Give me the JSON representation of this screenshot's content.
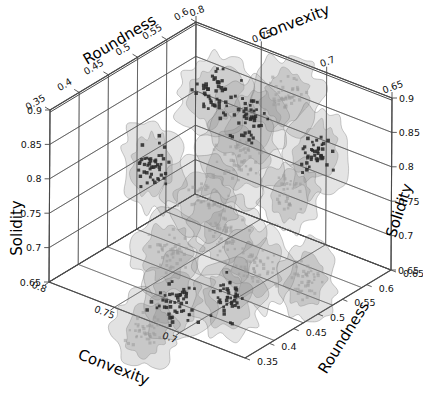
{
  "figure": {
    "type": "3d-scatter",
    "background": "#ffffff",
    "line_color": "#4a4a4a",
    "blob_fill": "#8c8c8c",
    "point_dark": "#2b2b2b",
    "point_light": "#9a9a9a"
  },
  "axes": {
    "top_left": {
      "name": "roundness-top-left",
      "title": "Roundness",
      "ticks": [
        "0.35",
        "0.4",
        "0.45",
        "0.5",
        "0.55",
        "0.6"
      ]
    },
    "top_right": {
      "name": "convexity-top-right",
      "title": "Convexity",
      "ticks": [
        "0.8",
        "0.75",
        "0.7",
        "0.65"
      ]
    },
    "left": {
      "name": "solidity-left",
      "title": "Solidity",
      "ticks": [
        "0.9",
        "0.85",
        "0.8",
        "0.75",
        "0.7",
        "0.65"
      ]
    },
    "right": {
      "name": "solidity-right",
      "title": "Solidity",
      "ticks": [
        "0.9",
        "0.85",
        "0.8",
        "0.75",
        "0.7",
        "0.65"
      ]
    },
    "bottom_left": {
      "name": "convexity-bottom-left",
      "title": "Convexity",
      "ticks": [
        "0.8",
        "0.75",
        "0.7"
      ]
    },
    "bottom_right": {
      "name": "roundness-bottom-right",
      "title": "Roundness",
      "ticks": [
        "0.65",
        "0.6",
        "0.55",
        "0.5",
        "0.45",
        "0.4",
        "0.35"
      ]
    }
  },
  "chart_data": {
    "type": "scatter",
    "title": "",
    "xlabel": "Roundness",
    "ylabel": "Convexity",
    "zlabel": "Solidity",
    "xlim": [
      0.35,
      0.6
    ],
    "ylim": [
      0.65,
      0.8
    ],
    "zlim": [
      0.65,
      0.9
    ],
    "grid": true,
    "legend": "none",
    "projection": "3d-isometric",
    "clusters": [
      {
        "id": "c1",
        "cx": 152,
        "cy": 165,
        "rx": 32,
        "ry": 48,
        "rot": -8,
        "shade": 0.46,
        "n": 46,
        "point_tone": "dark",
        "spread": 20
      },
      {
        "id": "c2",
        "cx": 215,
        "cy": 96,
        "rx": 40,
        "ry": 46,
        "rot": 5,
        "shade": 0.38,
        "n": 52,
        "point_tone": "dark",
        "spread": 24
      },
      {
        "id": "c3",
        "cx": 252,
        "cy": 120,
        "rx": 40,
        "ry": 44,
        "rot": -4,
        "shade": 0.3,
        "n": 40,
        "point_tone": "dark",
        "spread": 22
      },
      {
        "id": "c4",
        "cx": 286,
        "cy": 96,
        "rx": 36,
        "ry": 42,
        "rot": 10,
        "shade": 0.52,
        "n": 44,
        "point_tone": "light",
        "spread": 22
      },
      {
        "id": "c5",
        "cx": 316,
        "cy": 152,
        "rx": 32,
        "ry": 46,
        "rot": -6,
        "shade": 0.44,
        "n": 42,
        "point_tone": "dark",
        "spread": 20
      },
      {
        "id": "c6",
        "cx": 238,
        "cy": 160,
        "rx": 44,
        "ry": 48,
        "rot": 0,
        "shade": 0.42,
        "n": 48,
        "point_tone": "light",
        "spread": 26
      },
      {
        "id": "c7",
        "cx": 168,
        "cy": 252,
        "rx": 36,
        "ry": 44,
        "rot": -6,
        "shade": 0.5,
        "n": 44,
        "point_tone": "light",
        "spread": 22
      },
      {
        "id": "c8",
        "cx": 226,
        "cy": 236,
        "rx": 38,
        "ry": 44,
        "rot": 4,
        "shade": 0.4,
        "n": 46,
        "point_tone": "light",
        "spread": 23
      },
      {
        "id": "c9",
        "cx": 258,
        "cy": 268,
        "rx": 36,
        "ry": 44,
        "rot": -3,
        "shade": 0.36,
        "n": 42,
        "point_tone": "light",
        "spread": 22
      },
      {
        "id": "c10",
        "cx": 176,
        "cy": 300,
        "rx": 38,
        "ry": 44,
        "rot": 6,
        "shade": 0.44,
        "n": 48,
        "point_tone": "dark",
        "spread": 23
      },
      {
        "id": "c11",
        "cx": 228,
        "cy": 300,
        "rx": 36,
        "ry": 42,
        "rot": -5,
        "shade": 0.48,
        "n": 40,
        "point_tone": "dark",
        "spread": 21
      },
      {
        "id": "c12",
        "cx": 146,
        "cy": 330,
        "rx": 34,
        "ry": 40,
        "rot": 8,
        "shade": 0.56,
        "n": 38,
        "point_tone": "light",
        "spread": 20
      },
      {
        "id": "c13",
        "cx": 306,
        "cy": 282,
        "rx": 30,
        "ry": 42,
        "rot": -2,
        "shade": 0.6,
        "n": 40,
        "point_tone": "light",
        "spread": 19
      },
      {
        "id": "c14",
        "cx": 202,
        "cy": 198,
        "rx": 40,
        "ry": 42,
        "rot": 0,
        "shade": 0.34,
        "n": 36,
        "point_tone": "light",
        "spread": 22
      },
      {
        "id": "c15",
        "cx": 290,
        "cy": 196,
        "rx": 30,
        "ry": 38,
        "rot": 6,
        "shade": 0.54,
        "n": 30,
        "point_tone": "light",
        "spread": 18
      }
    ]
  }
}
